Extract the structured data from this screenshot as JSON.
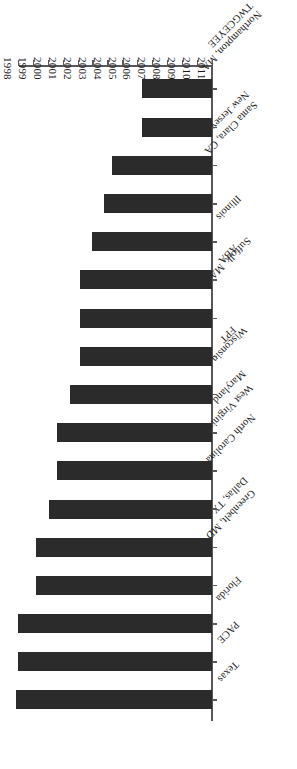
{
  "chart_data": {
    "type": "bar",
    "orientation": "horizontal",
    "title": "",
    "subtitle": "",
    "xlabel": "",
    "ylabel": "",
    "grid": false,
    "legend": "none",
    "rotation_degrees": 180,
    "axis_note": "Value axis reads years descending left-to-right: 2011 at the origin end, 1998 at the far end.",
    "xlim": [
      2011,
      1998
    ],
    "x_tick_labels": [
      "2011",
      "2010",
      "2009",
      "2008",
      "2007",
      "2006",
      "2005",
      "2004",
      "2003",
      "2002",
      "2001",
      "2000",
      "1999",
      "1998"
    ],
    "categories": [
      "Texas",
      "PACE",
      "Florida",
      "Greenbelt, MD",
      "Dallas, TX",
      "North Carolina",
      "West Virginia",
      "Maryland",
      "Wisconsin",
      "FPT",
      "Suffolk, MA",
      "ABA",
      "Illinois",
      "Santa Clara, CA",
      "New Jersey",
      "Northampton, MA",
      "TWGCEYEE"
    ],
    "values": [
      1998,
      1998.2,
      1998.2,
      1999.9,
      1999.9,
      2001.0,
      2001.8,
      2001.8,
      2003.0,
      2003.9,
      2003.9,
      2003.9,
      2005.0,
      2006.1,
      2006.9,
      2009.9,
      2009.9
    ],
    "bar_lengths_px": [
      196,
      194,
      194,
      176,
      176,
      163,
      155,
      155,
      142,
      132,
      132,
      132,
      120,
      108,
      100,
      70,
      70
    ],
    "value_meaning": "Start year of the record; longer bar = earlier start year"
  },
  "axis": {
    "category_labels": [
      "Texas",
      "PACE",
      "Florida",
      "Greenbelt, MD",
      "Dallas, TX",
      "North Carolina",
      "West Virginia",
      "Maryland",
      "Wisconsin",
      "FPT",
      "Suffolk, MA",
      "ABA",
      "Illinois",
      "Santa Clara, CA",
      "New Jersey",
      "Northampton, MA",
      "TWGCEYEE"
    ],
    "year_labels": [
      "2011",
      "2010",
      "2009",
      "2008",
      "2007",
      "2006",
      "2005",
      "2004",
      "2003",
      "2002",
      "2001",
      "2000",
      "1999",
      "1998"
    ]
  },
  "style": {
    "bar_color": "#2b2b2b",
    "axis_color": "#58585a",
    "background": "#ffffff",
    "text_color": "#1a1a1a"
  }
}
